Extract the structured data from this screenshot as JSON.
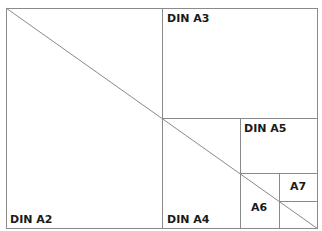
{
  "diagram": {
    "line_color": "#8a8a8a",
    "labels": {
      "a2": "DIN A2",
      "a3": "DIN A3",
      "a4": "DIN A4",
      "a5": "DIN A5",
      "a6": "A6",
      "a7": "A7"
    }
  }
}
